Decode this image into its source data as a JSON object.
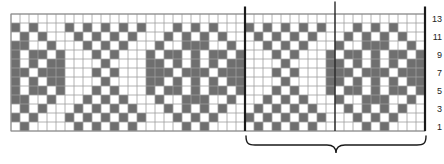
{
  "page": {
    "background": "#ffffff"
  },
  "chart_data": {
    "type": "knitting-colorwork-chart",
    "columns": 46,
    "rows": 13,
    "row_labels": [
      {
        "row": 13,
        "text": "13"
      },
      {
        "row": 11,
        "text": "11"
      },
      {
        "row": 9,
        "text": "9"
      },
      {
        "row": 7,
        "text": "7"
      },
      {
        "row": 5,
        "text": "5"
      },
      {
        "row": 3,
        "text": "3"
      },
      {
        "row": 1,
        "text": "1"
      }
    ],
    "marker_lines_after_columns": [
      26,
      36,
      46
    ],
    "repeat": {
      "start_column": 27,
      "end_column": 46,
      "brace": true
    },
    "dark_cells_by_row": [
      {
        "row": 13,
        "cols": []
      },
      {
        "row": 12,
        "cols": [
          1,
          3,
          7,
          9,
          11,
          13,
          15,
          19,
          21,
          23,
          27,
          29,
          31,
          33,
          35,
          39,
          41,
          43
        ]
      },
      {
        "row": 11,
        "cols": [
          2,
          4,
          8,
          10,
          12,
          14,
          18,
          20,
          22,
          24,
          28,
          30,
          32,
          34,
          38,
          40,
          42,
          44
        ]
      },
      {
        "row": 10,
        "cols": [
          1,
          2,
          5,
          9,
          11,
          13,
          17,
          20,
          21,
          22,
          25,
          29,
          31,
          33,
          37,
          40,
          41,
          42,
          45
        ]
      },
      {
        "row": 9,
        "cols": [
          1,
          3,
          4,
          6,
          10,
          12,
          16,
          18,
          19,
          21,
          23,
          24,
          26,
          30,
          32,
          36,
          38,
          39,
          41,
          43,
          44,
          46
        ]
      },
      {
        "row": 8,
        "cols": [
          1,
          3,
          5,
          6,
          11,
          16,
          17,
          19,
          21,
          23,
          25,
          26,
          31,
          36,
          37,
          39,
          41,
          43,
          45,
          46
        ]
      },
      {
        "row": 7,
        "cols": [
          1,
          2,
          4,
          5,
          6,
          10,
          12,
          16,
          17,
          18,
          20,
          21,
          22,
          24,
          25,
          26,
          30,
          32,
          36,
          37,
          38,
          40,
          41,
          42,
          44,
          45,
          46
        ]
      },
      {
        "row": 6,
        "cols": [
          1,
          3,
          5,
          6,
          11,
          16,
          17,
          19,
          21,
          23,
          25,
          26,
          31,
          36,
          37,
          39,
          41,
          43,
          45,
          46
        ]
      },
      {
        "row": 5,
        "cols": [
          1,
          3,
          4,
          6,
          10,
          12,
          16,
          18,
          19,
          21,
          23,
          24,
          26,
          30,
          32,
          36,
          38,
          39,
          41,
          43,
          44,
          46
        ]
      },
      {
        "row": 4,
        "cols": [
          1,
          2,
          5,
          9,
          11,
          13,
          17,
          20,
          21,
          22,
          25,
          29,
          31,
          33,
          37,
          40,
          41,
          42,
          45
        ]
      },
      {
        "row": 3,
        "cols": [
          2,
          4,
          8,
          10,
          12,
          14,
          18,
          20,
          22,
          24,
          28,
          30,
          32,
          34,
          38,
          40,
          42,
          44
        ]
      },
      {
        "row": 2,
        "cols": [
          1,
          3,
          7,
          9,
          11,
          13,
          15,
          19,
          21,
          23,
          27,
          29,
          31,
          33,
          35,
          39,
          41,
          43
        ]
      },
      {
        "row": 1,
        "cols": [
          2,
          8,
          10,
          12,
          14,
          20,
          22,
          28,
          30,
          32,
          34,
          40,
          42
        ]
      }
    ],
    "colors": {
      "dark_cell": "#6f6f6f",
      "grid_line": "#a0a0a0",
      "outer_border": "#8a8a8a",
      "marker_line": "#1a1a1a",
      "brace": "#1a1a1a",
      "label_text": "#222222",
      "background": "#ffffff"
    }
  }
}
